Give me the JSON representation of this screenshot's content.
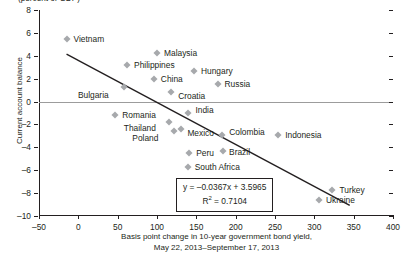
{
  "top_caption": "(percent of GDP)",
  "axes": {
    "ylabel": "Current account balance",
    "xlabel_line1": "Basis point change in 10-year government bond yield,",
    "xlabel_line2": "May 22, 2013–September 17, 2013",
    "yticks": [
      "8",
      "6",
      "4",
      "2",
      "0",
      "–2",
      "–4",
      "–6",
      "–8",
      "–10"
    ],
    "xticks": [
      "–50",
      "0",
      "50",
      "100",
      "150",
      "200",
      "250",
      "300",
      "350",
      "400"
    ]
  },
  "equation": {
    "line1_prefix": "y  =  –0.0367x + 3.5965",
    "line2_prefix": "R",
    "line2_sup": "2",
    "line2_suffix": " =  0.7104"
  },
  "chart_data": {
    "type": "scatter",
    "title": "",
    "xlabel": "Basis point change in 10-year government bond yield, May 22, 2013–September 17, 2013",
    "ylabel": "Current account balance (percent of GDP)",
    "xlim": [
      -50,
      400
    ],
    "ylim": [
      -10,
      8
    ],
    "grid": false,
    "legend": false,
    "marker_color": "#a7a9ac",
    "trendline_color": "#231f20",
    "trendline": {
      "slope": -0.0367,
      "intercept": 3.5965,
      "r_squared": 0.7104,
      "x_start": -15,
      "x_end": 345
    },
    "points": [
      {
        "label": "Vietnam",
        "x": -15,
        "y": 5.5,
        "label_dx": 7,
        "label_dy": 0
      },
      {
        "label": "Malaysia",
        "x": 100,
        "y": 4.2,
        "label_dx": 7,
        "label_dy": 0
      },
      {
        "label": "Philippines",
        "x": 62,
        "y": 3.2,
        "label_dx": 7,
        "label_dy": 0
      },
      {
        "label": "Hungary",
        "x": 147,
        "y": 2.7,
        "label_dx": 7,
        "label_dy": 0
      },
      {
        "label": "China",
        "x": 96,
        "y": 2.0,
        "label_dx": 7,
        "label_dy": 0
      },
      {
        "label": "Russia",
        "x": 177,
        "y": 1.5,
        "label_dx": 7,
        "label_dy": 0
      },
      {
        "label": "Bulgaria",
        "x": 58,
        "y": 1.3,
        "label_dx": -46,
        "label_dy": 8
      },
      {
        "label": "Croatia",
        "x": 118,
        "y": 0.8,
        "label_dx": 7,
        "label_dy": 4
      },
      {
        "label": "Romania",
        "x": 47,
        "y": -1.2,
        "label_dx": 7,
        "label_dy": 0
      },
      {
        "label": "India",
        "x": 140,
        "y": -1.0,
        "label_dx": 7,
        "label_dy": -3
      },
      {
        "label": "Thailand",
        "x": 115,
        "y": -1.8,
        "label_dx": -45,
        "label_dy": 6
      },
      {
        "label": "Poland",
        "x": 122,
        "y": -2.6,
        "label_dx": -42,
        "label_dy": 7
      },
      {
        "label": "Mexico",
        "x": 131,
        "y": -2.4,
        "label_dx": 6,
        "label_dy": 4
      },
      {
        "label": "Colombia",
        "x": 183,
        "y": -2.9,
        "label_dx": 7,
        "label_dy": -3
      },
      {
        "label": "Indonesia",
        "x": 254,
        "y": -2.9,
        "label_dx": 7,
        "label_dy": 0
      },
      {
        "label": "Peru",
        "x": 141,
        "y": -4.5,
        "label_dx": 7,
        "label_dy": 0
      },
      {
        "label": "Brazil",
        "x": 184,
        "y": -4.3,
        "label_dx": 6,
        "label_dy": 1
      },
      {
        "label": "South Africa",
        "x": 139,
        "y": -5.7,
        "label_dx": 7,
        "label_dy": 0
      },
      {
        "label": "Turkey",
        "x": 323,
        "y": -7.7,
        "label_dx": 7,
        "label_dy": 0
      },
      {
        "label": "Ukraine",
        "x": 306,
        "y": -8.6,
        "label_dx": 7,
        "label_dy": 0
      }
    ]
  }
}
